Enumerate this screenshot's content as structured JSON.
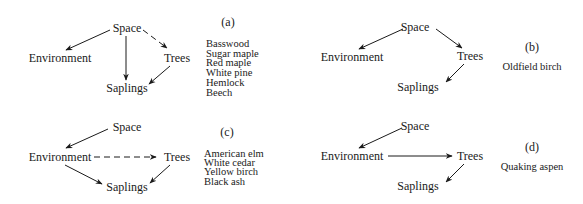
{
  "figure": {
    "panels": [
      {
        "id": "a",
        "label": "(a)",
        "nodes": {
          "space": "Space",
          "environment": "Environment",
          "trees": "Trees",
          "saplings": "Saplings"
        },
        "edges": [
          {
            "from": "Space",
            "to": "Environment",
            "style": "solid"
          },
          {
            "from": "Space",
            "to": "Trees",
            "style": "dashed"
          },
          {
            "from": "Space",
            "to": "Saplings",
            "style": "solid"
          },
          {
            "from": "Trees",
            "to": "Saplings",
            "style": "solid"
          }
        ],
        "species": [
          "Basswood",
          "Sugar maple",
          "Red maple",
          "White pine",
          "Hemlock",
          "Beech"
        ]
      },
      {
        "id": "b",
        "label": "(b)",
        "nodes": {
          "space": "Space",
          "environment": "Environment",
          "trees": "Trees",
          "saplings": "Saplings"
        },
        "edges": [
          {
            "from": "Space",
            "to": "Environment",
            "style": "solid"
          },
          {
            "from": "Space",
            "to": "Trees",
            "style": "solid"
          },
          {
            "from": "Trees",
            "to": "Saplings",
            "style": "solid"
          }
        ],
        "species": [
          "Oldfield birch"
        ]
      },
      {
        "id": "c",
        "label": "(c)",
        "nodes": {
          "space": "Space",
          "environment": "Environment",
          "trees": "Trees",
          "saplings": "Saplings"
        },
        "edges": [
          {
            "from": "Space",
            "to": "Environment",
            "style": "solid"
          },
          {
            "from": "Environment",
            "to": "Trees",
            "style": "dashed"
          },
          {
            "from": "Environment",
            "to": "Saplings",
            "style": "solid"
          },
          {
            "from": "Trees",
            "to": "Saplings",
            "style": "solid"
          }
        ],
        "species": [
          "American elm",
          "White cedar",
          "Yellow birch",
          "Black ash"
        ]
      },
      {
        "id": "d",
        "label": "(d)",
        "nodes": {
          "space": "Space",
          "environment": "Environment",
          "trees": "Trees",
          "saplings": "Saplings"
        },
        "edges": [
          {
            "from": "Space",
            "to": "Environment",
            "style": "solid"
          },
          {
            "from": "Environment",
            "to": "Trees",
            "style": "solid"
          },
          {
            "from": "Trees",
            "to": "Saplings",
            "style": "solid"
          }
        ],
        "species": [
          "Quaking aspen"
        ]
      }
    ]
  }
}
